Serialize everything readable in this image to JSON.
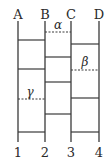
{
  "diagram": {
    "type": "amidakuji-ladder",
    "top_labels": [
      "A",
      "B",
      "C",
      "D"
    ],
    "bottom_labels": [
      "1",
      "2",
      "3",
      "4"
    ],
    "greek_labels": {
      "alpha": "α",
      "beta": "β",
      "gamma": "γ"
    },
    "line_color": "#3a3a3a",
    "columns_x": [
      18,
      45,
      71,
      99
    ],
    "rail_top": 21,
    "rail_bottom": 142,
    "rungs": [
      {
        "from": 0,
        "to": 1,
        "y": 40,
        "style": "solid"
      },
      {
        "from": 0,
        "to": 1,
        "y": 69,
        "style": "solid"
      },
      {
        "from": 0,
        "to": 1,
        "y": 99,
        "style": "dashed",
        "label": "γ"
      },
      {
        "from": 0,
        "to": 1,
        "y": 132,
        "style": "solid"
      },
      {
        "from": 1,
        "to": 2,
        "y": 32,
        "style": "dashed",
        "label": "α"
      },
      {
        "from": 1,
        "to": 2,
        "y": 57,
        "style": "solid"
      },
      {
        "from": 1,
        "to": 2,
        "y": 82,
        "style": "solid"
      },
      {
        "from": 1,
        "to": 2,
        "y": 114,
        "style": "solid"
      },
      {
        "from": 2,
        "to": 3,
        "y": 44,
        "style": "solid"
      },
      {
        "from": 2,
        "to": 3,
        "y": 70,
        "style": "dashed",
        "label": "β"
      },
      {
        "from": 2,
        "to": 3,
        "y": 98,
        "style": "solid"
      },
      {
        "from": 2,
        "to": 3,
        "y": 132,
        "style": "solid"
      }
    ]
  }
}
